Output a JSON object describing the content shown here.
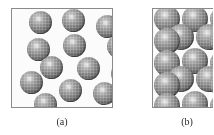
{
  "figure": {
    "background_color": "#ffffff",
    "panel_fill_color": "#fbfbfb",
    "panel_border_color": "#8a8a8a",
    "sphere_color_light": "#d8d8d8",
    "sphere_color_mid": "#7e7e7e",
    "sphere_color_dark": "#3a3a3a"
  },
  "panels": [
    {
      "id": "a",
      "caption": "(a)",
      "description": "Randomly dispersed spheres",
      "frame": {
        "x": 11,
        "y": 8,
        "width": 102,
        "height": 100
      },
      "sphere_diameter": 23,
      "sphere_count": 13,
      "spheres": [
        {
          "cx": 17,
          "cy": 2,
          "d": 23
        },
        {
          "cx": 50,
          "cy": 0,
          "d": 23
        },
        {
          "cx": 84,
          "cy": 6,
          "d": 23
        },
        {
          "cx": 15,
          "cy": 29,
          "d": 23
        },
        {
          "cx": 51,
          "cy": 25,
          "d": 23
        },
        {
          "cx": 95,
          "cy": 26,
          "d": 23
        },
        {
          "cx": 28,
          "cy": 47,
          "d": 23
        },
        {
          "cx": 65,
          "cy": 48,
          "d": 23
        },
        {
          "cx": 99,
          "cy": 53,
          "d": 23
        },
        {
          "cx": 8,
          "cy": 62,
          "d": 23
        },
        {
          "cx": 47,
          "cy": 70,
          "d": 23
        },
        {
          "cx": 81,
          "cy": 73,
          "d": 23
        },
        {
          "cx": 22,
          "cy": 84,
          "d": 23
        }
      ]
    },
    {
      "id": "b",
      "caption": "(b)",
      "description": "Close-packed spheres",
      "frame": {
        "x": 152,
        "y": 8,
        "width": 61,
        "height": 100
      },
      "sphere_diameter": 26,
      "sphere_count": 16,
      "rows": 5,
      "columns_per_row": [
        3,
        3,
        3,
        3,
        3
      ],
      "row_offset_alternating": true,
      "spheres": [
        {
          "cx": 1,
          "cy": -3,
          "d": 26
        },
        {
          "cx": 29,
          "cy": -3,
          "d": 26
        },
        {
          "cx": 57,
          "cy": -3,
          "d": 26
        },
        {
          "cx": 15,
          "cy": 15,
          "d": 26
        },
        {
          "cx": 43,
          "cy": 15,
          "d": 26
        },
        {
          "cx": 1,
          "cy": 19,
          "d": 26
        },
        {
          "cx": 57,
          "cy": 19,
          "d": 26
        },
        {
          "cx": 1,
          "cy": 41,
          "d": 26
        },
        {
          "cx": 29,
          "cy": 39,
          "d": 26
        },
        {
          "cx": 57,
          "cy": 41,
          "d": 26
        },
        {
          "cx": 15,
          "cy": 57,
          "d": 26
        },
        {
          "cx": 43,
          "cy": 57,
          "d": 26
        },
        {
          "cx": 1,
          "cy": 63,
          "d": 26
        },
        {
          "cx": 57,
          "cy": 63,
          "d": 26
        },
        {
          "cx": 1,
          "cy": 84,
          "d": 26
        },
        {
          "cx": 29,
          "cy": 82,
          "d": 26
        },
        {
          "cx": 57,
          "cy": 84,
          "d": 26
        }
      ]
    }
  ]
}
